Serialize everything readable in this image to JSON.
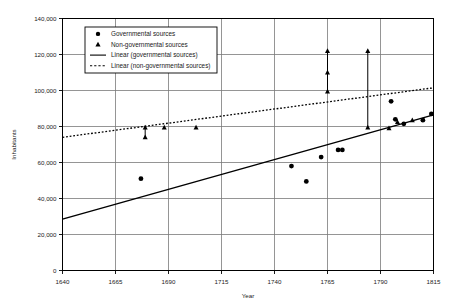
{
  "chart_data": {
    "type": "scatter",
    "title": "",
    "xlabel": "Year",
    "ylabel": "Inhabitants",
    "xlim": [
      1640,
      1815
    ],
    "ylim": [
      0,
      140000
    ],
    "xticks": [
      1640,
      1665,
      1690,
      1715,
      1740,
      1765,
      1790,
      1815
    ],
    "xtick_labels": [
      "1640",
      "1665",
      "1690",
      "1715",
      "1740",
      "1765",
      "1790",
      "1815"
    ],
    "yticks": [
      0,
      20000,
      40000,
      60000,
      80000,
      100000,
      120000,
      140000
    ],
    "ytick_labels": [
      "0",
      "20,000",
      "40,000",
      "60,000",
      "80,000",
      "100,000",
      "120,000",
      "140,000"
    ],
    "grid": true,
    "legend_position": "upper-left",
    "series": [
      {
        "name": "Governmental sources",
        "marker": "circle",
        "color": "#000000",
        "points": [
          [
            1677,
            51000
          ],
          [
            1748,
            58000
          ],
          [
            1755,
            49500
          ],
          [
            1762,
            63000
          ],
          [
            1770,
            67000
          ],
          [
            1772,
            67000
          ],
          [
            1795,
            94000
          ],
          [
            1797,
            84000
          ],
          [
            1801,
            81500
          ],
          [
            1810,
            83500
          ],
          [
            1814,
            87000
          ]
        ]
      },
      {
        "name": "Non-governmental sources",
        "marker": "triangle",
        "color": "#000000",
        "points": [
          [
            1679,
            79500
          ],
          [
            1679,
            74000
          ],
          [
            1688,
            79500
          ],
          [
            1703,
            79500
          ],
          [
            1765,
            99500
          ],
          [
            1765,
            110000
          ],
          [
            1765,
            122000
          ],
          [
            1784,
            79500
          ],
          [
            1784,
            122000
          ],
          [
            1794,
            79000
          ],
          [
            1798,
            82500
          ],
          [
            1805,
            83500
          ]
        ]
      }
    ],
    "ranges": [
      {
        "x": 1679,
        "y_low": 74000,
        "y_high": 79500
      },
      {
        "x": 1765,
        "y_low": 99500,
        "y_high": 122000
      },
      {
        "x": 1784,
        "y_low": 79500,
        "y_high": 122000
      }
    ],
    "trendlines": [
      {
        "name": "Linear (governmental sources)",
        "style": "solid",
        "color": "#000000",
        "x_start": 1640,
        "y_start": 28500,
        "x_end": 1815,
        "y_end": 86500
      },
      {
        "name": "Linear (non-governmental sources)",
        "style": "dotted",
        "color": "#000000",
        "x_start": 1640,
        "y_start": 74000,
        "x_end": 1815,
        "y_end": 101500
      }
    ],
    "legend": [
      {
        "label": "Governmental sources",
        "symbol": "circle"
      },
      {
        "label": "Non-governmental sources",
        "symbol": "triangle"
      },
      {
        "label": "Linear (governmental sources)",
        "symbol": "solid-line"
      },
      {
        "label": "Linear (non-governmental sources)",
        "symbol": "dotted-line"
      }
    ]
  }
}
